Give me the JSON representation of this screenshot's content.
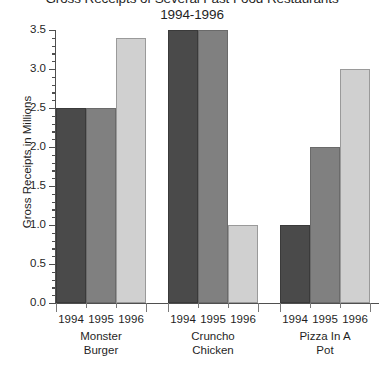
{
  "chart_data": {
    "type": "bar",
    "title": "Gross Receipts of Several Fast Food Restaurants",
    "subtitle": "1994-1996",
    "xlabel": "",
    "ylabel": "Gross Receipts in Millions",
    "ylim": [
      0.0,
      3.5
    ],
    "ytick_step": 0.5,
    "yminor_step": 0.1,
    "grid": false,
    "legend": "none",
    "categories": [
      "1994",
      "1995",
      "1996"
    ],
    "groups": [
      {
        "name_line1": "Monster",
        "name_line2": "Burger",
        "values": [
          2.5,
          2.5,
          3.4
        ]
      },
      {
        "name_line1": "Cruncho",
        "name_line2": "Chicken",
        "values": [
          3.5,
          3.5,
          1.0
        ]
      },
      {
        "name_line1": "Pizza In A",
        "name_line2": "Pot",
        "values": [
          1.0,
          2.0,
          3.0
        ]
      }
    ],
    "series": [
      {
        "name": "1994",
        "color": "#4a4a4a",
        "values": [
          2.5,
          3.5,
          1.0
        ]
      },
      {
        "name": "1995",
        "color": "#808080",
        "values": [
          2.5,
          3.5,
          2.0
        ]
      },
      {
        "name": "1996",
        "color": "#d0d0d0",
        "values": [
          3.4,
          1.0,
          3.0
        ]
      }
    ],
    "ytick_labels": [
      "0.0",
      "0.5",
      "1.0",
      "1.5",
      "2.0",
      "2.5",
      "3.0",
      "3.5"
    ]
  }
}
